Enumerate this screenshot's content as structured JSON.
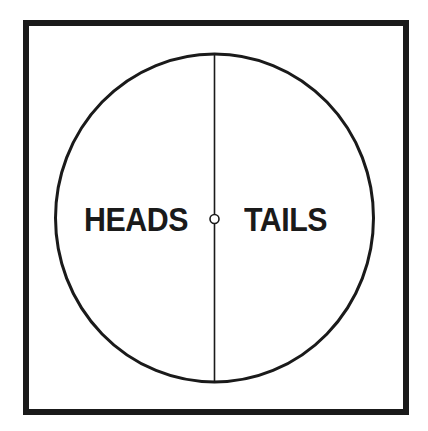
{
  "diagram": {
    "title": "",
    "labels": {
      "left": "HEADS",
      "right": "TAILS"
    },
    "shapes": {
      "frame": "square-frame",
      "circle": "coin-circle",
      "divider": "vertical-divider-line",
      "center": "small-center-circle"
    },
    "colors": {
      "stroke": "#1a1a1a",
      "background": "#ffffff"
    }
  }
}
